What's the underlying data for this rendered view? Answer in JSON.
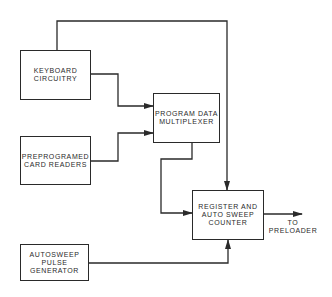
{
  "diagram": {
    "type": "block-diagram",
    "blocks": {
      "keyboard": {
        "label": "KEYBOARD\nCIRCUITRY"
      },
      "card_readers": {
        "label": "PREPROGRAMED\nCARD READERS"
      },
      "multiplexer": {
        "label": "PROGRAM DATA\nMULTIPLEXER"
      },
      "register": {
        "label": "REGISTER AND\nAUTO SWEEP\nCOUNTER"
      },
      "pulse_generator": {
        "label": "AUTOSWEEP\nPULSE\nGENERATOR"
      }
    },
    "output_label": "TO\nPRELOADER",
    "connections": [
      {
        "from": "KEYBOARD CIRCUITRY",
        "to": "PROGRAM DATA MULTIPLEXER"
      },
      {
        "from": "PREPROGRAMED CARD READERS",
        "to": "PROGRAM DATA MULTIPLEXER"
      },
      {
        "from": "KEYBOARD CIRCUITRY",
        "to": "REGISTER AND AUTO SWEEP COUNTER"
      },
      {
        "from": "PROGRAM DATA MULTIPLEXER",
        "to": "REGISTER AND AUTO SWEEP COUNTER"
      },
      {
        "from": "AUTOSWEEP PULSE GENERATOR",
        "to": "REGISTER AND AUTO SWEEP COUNTER"
      },
      {
        "from": "REGISTER AND AUTO SWEEP COUNTER",
        "to": "TO PRELOADER"
      }
    ],
    "line_color": "#2a2a2a"
  }
}
